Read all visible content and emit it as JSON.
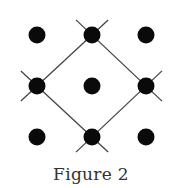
{
  "caption": "Figure 2",
  "colors": {
    "dot": "#0a0a0a",
    "line": "#444444",
    "background": "#ffffff"
  },
  "dot_radius": 8.5,
  "line_extension": 22,
  "grid": {
    "rows": 3,
    "cols": 3,
    "x": [
      37,
      92,
      146
    ],
    "y": [
      35,
      86,
      137
    ]
  },
  "dots": [
    {
      "id": "top-left",
      "x": 37,
      "y": 35
    },
    {
      "id": "top-center",
      "x": 92,
      "y": 35
    },
    {
      "id": "top-right",
      "x": 146,
      "y": 35
    },
    {
      "id": "middle-left",
      "x": 37,
      "y": 86
    },
    {
      "id": "center",
      "x": 92,
      "y": 86
    },
    {
      "id": "middle-right",
      "x": 146,
      "y": 86
    },
    {
      "id": "bottom-left",
      "x": 37,
      "y": 137
    },
    {
      "id": "bottom-center",
      "x": 92,
      "y": 137
    },
    {
      "id": "bottom-right",
      "x": 146,
      "y": 137
    }
  ],
  "diamond": {
    "vertices": [
      "top-center",
      "middle-right",
      "bottom-center",
      "middle-left"
    ],
    "edges": [
      {
        "from": [
          92,
          35
        ],
        "to": [
          146,
          86
        ]
      },
      {
        "from": [
          146,
          86
        ],
        "to": [
          92,
          137
        ]
      },
      {
        "from": [
          92,
          137
        ],
        "to": [
          37,
          86
        ]
      },
      {
        "from": [
          37,
          86
        ],
        "to": [
          92,
          35
        ]
      }
    ]
  }
}
